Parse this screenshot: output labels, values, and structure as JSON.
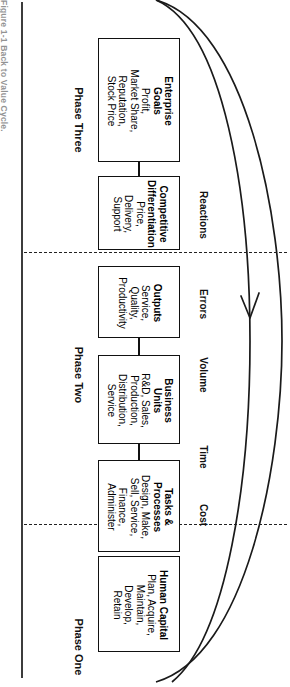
{
  "figure": {
    "caption": "Figure 1-1  Back to Value Cycle.",
    "title": "Back to Value Cycle"
  },
  "phases": [
    {
      "id": "phase-three",
      "label": "Phase Three"
    },
    {
      "id": "phase-two",
      "label": "Phase Two"
    },
    {
      "id": "phase-one",
      "label": "Phase One"
    }
  ],
  "boxes": [
    {
      "id": "enterprise-goals",
      "title": "Enterprise\nGoals",
      "body": "Profit,\nMarket Share,\nReputation,\nStock Price"
    },
    {
      "id": "competitive-differentiation",
      "title": "Competitive\nDifferentiation",
      "body": "Price,\nDelivery,\nSupport"
    },
    {
      "id": "outputs",
      "title": "Outputs",
      "body": "Service,\nQuality,\nProductivity"
    },
    {
      "id": "business-units",
      "title": "Business\nUnits",
      "body": "R&D, Sales,\nProduction,\nDistribution,\nService"
    },
    {
      "id": "tasks-processes",
      "title": "Tasks &\nProcesses",
      "body": "Design, Make,\nSell, Service,\nFinance,\nAdminister"
    },
    {
      "id": "human-capital",
      "title": "Human Capital",
      "body": "Plan, Acquire,\nMaintain,\nDevelop,\nRetain"
    }
  ],
  "measures": [
    {
      "id": "reactions",
      "label": "Reactions"
    },
    {
      "id": "errors",
      "label": "Errors"
    },
    {
      "id": "volume",
      "label": "Volume"
    },
    {
      "id": "time",
      "label": "Time"
    },
    {
      "id": "cost",
      "label": "Cost"
    }
  ],
  "colors": {
    "ink": "#111111",
    "paper": "#ffffff",
    "rule": "#3c3c3c",
    "caption": "#3a3a3a"
  }
}
